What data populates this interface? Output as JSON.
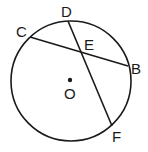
{
  "diagram": {
    "circle": {
      "center_label": "O",
      "cx": 71,
      "cy": 81,
      "r": 60
    },
    "points": [
      {
        "label": "C",
        "x": 30,
        "y": 37,
        "label_x": 16,
        "label_y": 37
      },
      {
        "label": "D",
        "x": 68,
        "y": 21,
        "label_x": 61,
        "label_y": 17
      },
      {
        "label": "E",
        "x": 80,
        "y": 52,
        "label_x": 84,
        "label_y": 50
      },
      {
        "label": "B",
        "x": 128,
        "y": 66,
        "label_x": 131,
        "label_y": 74
      },
      {
        "label": "F",
        "x": 112,
        "y": 126,
        "label_x": 112,
        "label_y": 142
      },
      {
        "label": "O",
        "x": 70,
        "y": 80,
        "label_x": 64,
        "label_y": 99
      }
    ],
    "chords": [
      {
        "from": "C",
        "to": "B"
      },
      {
        "from": "D",
        "to": "F"
      }
    ],
    "colors": {
      "stroke": "#1a1a1a",
      "background": "#ffffff"
    }
  }
}
